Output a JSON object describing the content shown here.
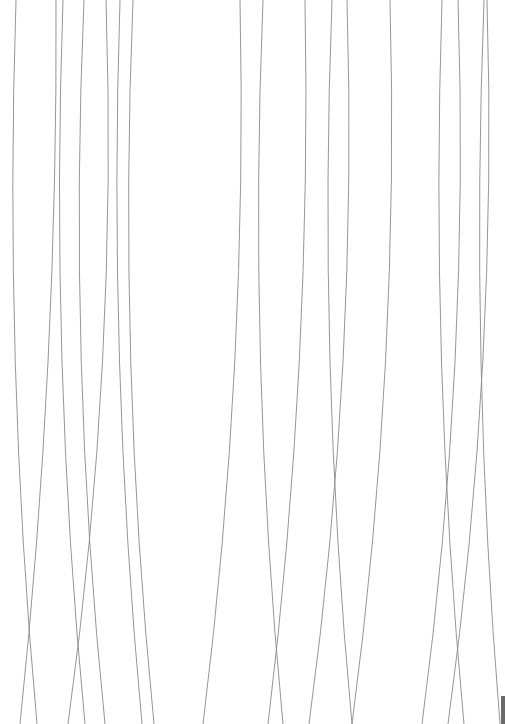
{
  "canvas": {
    "width": 505,
    "height": 724,
    "background": "#ffffff",
    "stroke": "#8a8a8a"
  },
  "curves": [
    {
      "x0": 16,
      "cx": 4,
      "x1": 37
    },
    {
      "x0": 56,
      "cx": 58,
      "x1": 20
    },
    {
      "x0": 63,
      "cx": 50,
      "x1": 85
    },
    {
      "x0": 84,
      "cx": 68,
      "x1": 105
    },
    {
      "x0": 106,
      "cx": 118,
      "x1": 68
    },
    {
      "x0": 120,
      "cx": 108,
      "x1": 142
    },
    {
      "x0": 133,
      "cx": 118,
      "x1": 154
    },
    {
      "x0": 240,
      "cx": 248,
      "x1": 203
    },
    {
      "x0": 263,
      "cx": 248,
      "x1": 283
    },
    {
      "x0": 305,
      "cx": 312,
      "x1": 268
    },
    {
      "x0": 332,
      "cx": 318,
      "x1": 352
    },
    {
      "x0": 347,
      "cx": 358,
      "x1": 309
    },
    {
      "x0": 390,
      "cx": 400,
      "x1": 352
    },
    {
      "x0": 442,
      "cx": 430,
      "x1": 464
    },
    {
      "x0": 458,
      "cx": 470,
      "x1": 422
    },
    {
      "x0": 484,
      "cx": 470,
      "x1": 500
    },
    {
      "x0": 487,
      "cx": 498,
      "x1": 448
    }
  ]
}
